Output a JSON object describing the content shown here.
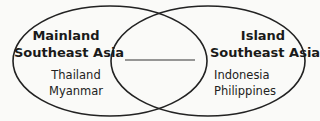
{
  "diagram": {
    "type": "venn",
    "sets": [
      {
        "title_line1": "Mainland",
        "title_line2": "Southeast Asia",
        "items": [
          "Thailand",
          "Myanmar"
        ]
      },
      {
        "title_line1": "Island",
        "title_line2": "Southeast Asia",
        "items": [
          "Indonesia",
          "Philippines"
        ]
      }
    ],
    "intersection": {
      "answer_blank": ""
    }
  }
}
